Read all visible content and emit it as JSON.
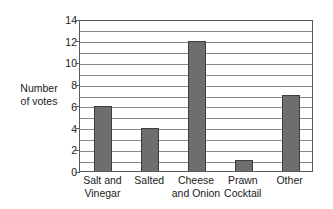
{
  "chart_data": {
    "type": "bar",
    "title": "",
    "xlabel": "",
    "ylabel": "Number of votes",
    "ylabel_lines": [
      "Number",
      "of votes"
    ],
    "categories": [
      "Salt and Vinegar",
      "Salted",
      "Cheese and Onion",
      "Prawn Cocktail",
      "Other"
    ],
    "category_lines": [
      [
        "Salt and",
        "Vinegar"
      ],
      [
        "Salted",
        ""
      ],
      [
        "Cheese",
        "and Onion"
      ],
      [
        "Prawn",
        "Cocktail"
      ],
      [
        "Other",
        ""
      ]
    ],
    "values": [
      6,
      4,
      12,
      1,
      7
    ],
    "ylim": [
      0,
      14
    ],
    "ytick_labels": [
      "0",
      "2",
      "4",
      "6",
      "8",
      "10",
      "12",
      "14"
    ],
    "ytick_values": [
      0,
      2,
      4,
      6,
      8,
      10,
      12,
      14
    ],
    "gridline_values": [
      1,
      2,
      3,
      4,
      5,
      6,
      7,
      8,
      9,
      10,
      11,
      12,
      13
    ],
    "grid": true,
    "legend": "none",
    "bar_color": "#6e6e6e",
    "bar_edge_color": "#3d3d3d",
    "grid_color": "#8a8a8a",
    "axis_color": "#5a5a5a",
    "background_color": "#ffffff"
  }
}
